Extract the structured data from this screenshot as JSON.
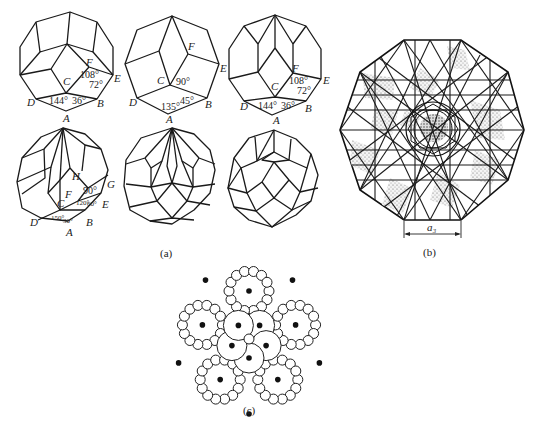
{
  "figure": {
    "panel_a": {
      "caption": "(a)",
      "polygons": [
        {
          "id": "decagon-top-left",
          "vertices": [
            "D",
            "A",
            "B",
            "E",
            "F",
            "C"
          ],
          "angles": [
            "144°",
            "36°",
            "108°",
            "72°"
          ]
        },
        {
          "id": "octagon-top-middle",
          "vertices": [
            "D",
            "A",
            "B",
            "E",
            "F",
            "C"
          ],
          "angles": [
            "135°",
            "45°",
            "90°"
          ]
        },
        {
          "id": "decagon-top-right",
          "vertices": [
            "D",
            "A",
            "B",
            "E",
            "F",
            "C"
          ],
          "angles": [
            "144°",
            "36°",
            "108°",
            "72°"
          ]
        },
        {
          "id": "dodecagon-bottom-left",
          "vertices": [
            "D",
            "A",
            "B",
            "E",
            "G",
            "F",
            "C",
            "H"
          ],
          "angles": [
            "150°",
            "30°",
            "120°",
            "60°",
            "90°"
          ]
        },
        {
          "id": "dodecagon-bottom-middle",
          "vertices": [],
          "angles": []
        },
        {
          "id": "dodecagon-bottom-right",
          "vertices": [],
          "angles": []
        }
      ],
      "labels": {
        "A": "A",
        "B": "B",
        "C": "C",
        "D": "D",
        "E": "E",
        "F": "F",
        "G": "G",
        "H": "H"
      }
    },
    "panel_b": {
      "caption": "(b)",
      "dimension_label": "a₃"
    },
    "panel_c": {
      "caption": "(c)"
    }
  }
}
